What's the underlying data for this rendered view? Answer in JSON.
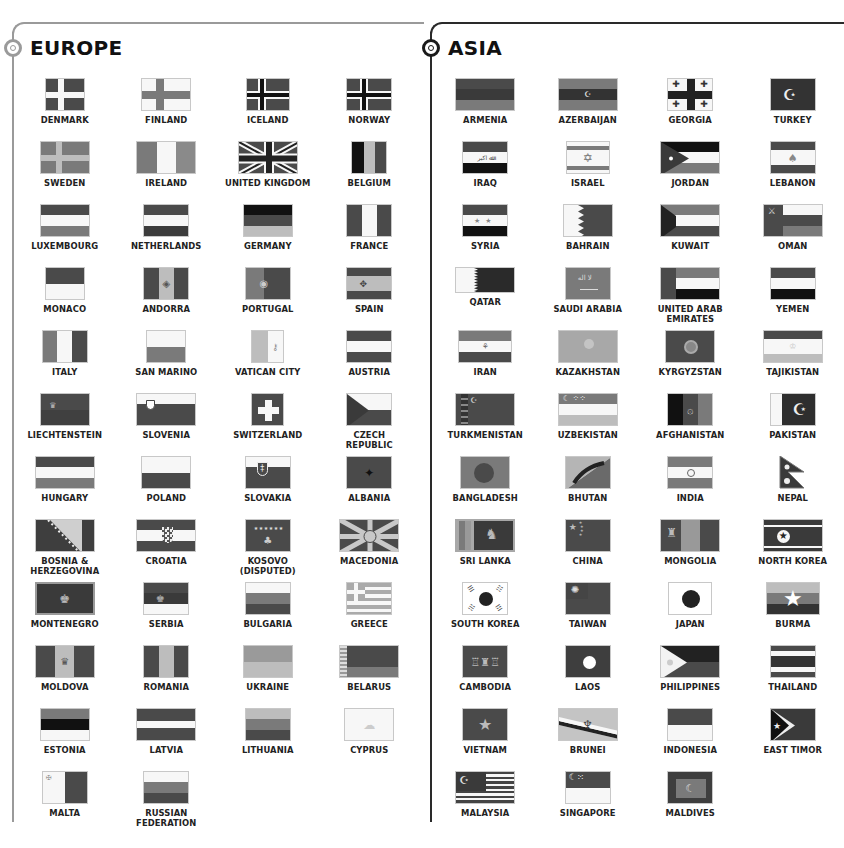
{
  "sections": {
    "europe": {
      "title": "EUROPE",
      "line_color": "#9a9a9a",
      "countries": [
        "DENMARK",
        "FINLAND",
        "ICELAND",
        "NORWAY",
        "SWEDEN",
        "IRELAND",
        "UNITED KINGDOM",
        "BELGIUM",
        "LUXEMBOURG",
        "NETHERLANDS",
        "GERMANY",
        "FRANCE",
        "MONACO",
        "ANDORRA",
        "PORTUGAL",
        "SPAIN",
        "ITALY",
        "SAN MARINO",
        "VATICAN CITY",
        "AUSTRIA",
        "LIECHTENSTEIN",
        "SLOVENIA",
        "SWITZERLAND",
        "CZECH\nREPUBLIC",
        "HUNGARY",
        "POLAND",
        "SLOVAKIA",
        "ALBANIA",
        "BOSNIA &\nHERZEGOVINA",
        "CROATIA",
        "KOSOVO\n(DISPUTED)",
        "MACEDONIA",
        "MONTENEGRO",
        "SERBIA",
        "BULGARIA",
        "GREECE",
        "MOLDOVA",
        "ROMANIA",
        "UKRAINE",
        "BELARUS",
        "ESTONIA",
        "LATVIA",
        "LITHUANIA",
        "CYPRUS",
        "MALTA",
        "RUSSIAN FEDERATION"
      ]
    },
    "asia": {
      "title": "ASIA",
      "line_color": "#1a1a1a",
      "countries": [
        "ARMENIA",
        "AZERBAIJAN",
        "GEORGIA",
        "TURKEY",
        "IRAQ",
        "ISRAEL",
        "JORDAN",
        "LEBANON",
        "SYRIA",
        "BAHRAIN",
        "KUWAIT",
        "OMAN",
        "QATAR",
        "SAUDI ARABIA",
        "UNITED ARAB\nEMIRATES",
        "YEMEN",
        "IRAN",
        "KAZAKHSTAN",
        "KYRGYZSTAN",
        "TAJIKISTAN",
        "TURKMENISTAN",
        "UZBEKISTAN",
        "AFGHANISTAN",
        "PAKISTAN",
        "BANGLADESH",
        "BHUTAN",
        "INDIA",
        "NEPAL",
        "SRI LANKA",
        "CHINA",
        "MONGOLIA",
        "NORTH KOREA",
        "SOUTH KOREA",
        "TAIWAN",
        "JAPAN",
        "BURMA",
        "CAMBODIA",
        "LAOS",
        "PHILIPPINES",
        "THAILAND",
        "VIETNAM",
        "BRUNEI",
        "INDONESIA",
        "EAST TIMOR",
        "MALAYSIA",
        "SINGAPORE",
        "MALDIVES"
      ]
    }
  },
  "flag_palette": {
    "dark": "#4a4a4a",
    "mid": "#7a7a7a",
    "light": "#bdbdbd",
    "white": "#f7f7f7",
    "black": "#111111"
  }
}
